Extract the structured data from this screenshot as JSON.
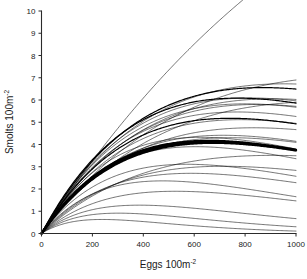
{
  "figure": {
    "background_color": "#ffffff",
    "line_color": "#000000",
    "axis_color": "#2b2b2b"
  },
  "axes": {
    "x_title_main": "Eggs 100m",
    "x_title_sup": "-2",
    "y_title_main": "Smolts 100m",
    "y_title_sup": "-2",
    "x_ticks": [
      "0",
      "200",
      "400",
      "600",
      "800",
      "1000"
    ],
    "y_ticks": [
      "0",
      "1",
      "2",
      "3",
      "4",
      "5",
      "6",
      "7",
      "8",
      "9",
      "10"
    ]
  },
  "chart_data": {
    "type": "line",
    "title": "",
    "xlabel": "Eggs 100m-2",
    "ylabel": "Smolts 100m-2",
    "xlim": [
      0,
      1000
    ],
    "ylim": [
      0,
      10
    ],
    "xticks": [
      0,
      200,
      400,
      600,
      800,
      1000
    ],
    "yticks": [
      0,
      1,
      2,
      3,
      4,
      5,
      6,
      7,
      8,
      9,
      10
    ],
    "grid": false,
    "legend": "none",
    "annotation": "Family of Ricker stock-recruitment curves, all passing through the origin. Each curve is R = a*S*exp(-b*S). Curves are overplotted, forming dense dark bands near y=3.2-3.8 and y=4.8-5.6.",
    "x": [
      0,
      25,
      50,
      75,
      100,
      125,
      150,
      175,
      200,
      250,
      300,
      350,
      400,
      450,
      500,
      550,
      600,
      650,
      700,
      750,
      800,
      850,
      900,
      950,
      1000
    ],
    "series": [
      {
        "name": "curve-01-highest",
        "emphasis": "normal",
        "a": 0.0152,
        "b": 0.00079,
        "values": [
          0,
          0.37,
          0.73,
          1.08,
          1.41,
          1.72,
          2.02,
          2.31,
          2.6,
          3.12,
          3.6,
          4.05,
          4.44,
          4.8,
          5.13,
          5.43,
          5.7,
          5.94,
          6.16,
          6.37,
          6.56,
          6.73,
          6.89,
          7.04,
          7.15
        ]
      },
      {
        "name": "curve-02-top",
        "emphasis": "normal",
        "a": 0.0175,
        "b": 0.00035,
        "values": [
          0,
          0.43,
          0.86,
          1.28,
          1.69,
          2.09,
          2.48,
          2.85,
          3.22,
          3.91,
          4.57,
          5.17,
          5.74,
          6.27,
          6.76,
          7.21,
          7.63,
          8.01,
          8.35,
          8.5,
          8.6,
          8.65,
          8.66,
          8.66,
          8.64
        ]
      },
      {
        "name": "curve-03",
        "emphasis": "normal",
        "a": 0.0168,
        "b": 0.0014,
        "values": [
          0,
          0.4,
          0.78,
          1.14,
          1.46,
          1.76,
          2.04,
          2.3,
          2.54,
          2.95,
          3.31,
          3.6,
          3.84,
          4.04,
          4.19,
          4.3,
          4.37,
          4.41,
          4.43,
          4.42,
          4.39,
          4.34,
          4.28,
          4.2,
          4.12
        ]
      },
      {
        "name": "curve-04-band-upper",
        "emphasis": "medium",
        "a": 0.0215,
        "b": 0.0013,
        "values": [
          0,
          0.52,
          1.0,
          1.46,
          1.89,
          2.28,
          2.65,
          3.0,
          3.32,
          3.88,
          4.36,
          4.77,
          5.11,
          5.39,
          5.6,
          5.75,
          5.86,
          5.92,
          5.94,
          5.94,
          5.9,
          5.85,
          5.77,
          5.68,
          5.58
        ]
      },
      {
        "name": "curve-05-band-upper",
        "emphasis": "medium",
        "a": 0.0205,
        "b": 0.00115,
        "values": [
          0,
          0.5,
          0.97,
          1.41,
          1.83,
          2.22,
          2.59,
          2.94,
          3.26,
          3.84,
          4.34,
          4.78,
          5.16,
          5.48,
          5.74,
          5.95,
          6.1,
          6.21,
          6.29,
          6.33,
          6.33,
          6.3,
          6.25,
          6.18,
          6.08
        ]
      },
      {
        "name": "curve-06",
        "emphasis": "normal",
        "a": 0.0192,
        "b": 0.00105,
        "values": [
          0,
          0.47,
          0.91,
          1.33,
          1.73,
          2.1,
          2.46,
          2.8,
          3.11,
          3.68,
          4.18,
          4.61,
          4.99,
          5.31,
          5.58,
          5.8,
          5.97,
          6.09,
          6.19,
          6.24,
          6.26,
          6.25,
          6.21,
          6.15,
          6.07
        ]
      },
      {
        "name": "curve-07",
        "emphasis": "normal",
        "a": 0.0188,
        "b": 0.0016,
        "values": [
          0,
          0.45,
          0.87,
          1.26,
          1.6,
          1.92,
          2.21,
          2.47,
          2.71,
          3.1,
          3.41,
          3.65,
          3.83,
          3.95,
          4.03,
          4.07,
          4.07,
          4.05,
          4.01,
          3.95,
          3.88,
          3.8,
          3.71,
          3.62,
          3.52
        ]
      },
      {
        "name": "curve-08-dense",
        "emphasis": "normal",
        "a": 0.0198,
        "b": 0.00125,
        "values": [
          0,
          0.48,
          0.93,
          1.35,
          1.75,
          2.12,
          2.46,
          2.78,
          3.08,
          3.6,
          4.05,
          4.42,
          4.73,
          4.98,
          5.17,
          5.31,
          5.41,
          5.46,
          5.48,
          5.47,
          5.44,
          5.38,
          5.31,
          5.22,
          5.12
        ]
      },
      {
        "name": "curve-09-dense",
        "emphasis": "normal",
        "a": 0.0202,
        "b": 0.00122,
        "values": [
          0,
          0.49,
          0.95,
          1.38,
          1.79,
          2.17,
          2.52,
          2.85,
          3.16,
          3.7,
          4.17,
          4.56,
          4.88,
          5.14,
          5.34,
          5.49,
          5.59,
          5.65,
          5.67,
          5.67,
          5.64,
          5.58,
          5.51,
          5.42,
          5.32
        ]
      },
      {
        "name": "curve-10-dense-dark",
        "emphasis": "medium",
        "a": 0.019,
        "b": 0.00135,
        "values": [
          0,
          0.46,
          0.89,
          1.29,
          1.66,
          2.0,
          2.33,
          2.62,
          2.9,
          3.37,
          3.77,
          4.09,
          4.35,
          4.55,
          4.7,
          4.8,
          4.86,
          4.89,
          4.89,
          4.86,
          4.81,
          4.74,
          4.66,
          4.57,
          4.47
        ]
      },
      {
        "name": "curve-11-dense",
        "emphasis": "normal",
        "a": 0.0186,
        "b": 0.00118,
        "values": [
          0,
          0.45,
          0.88,
          1.28,
          1.65,
          2.0,
          2.34,
          2.65,
          2.94,
          3.46,
          3.91,
          4.28,
          4.59,
          4.84,
          5.04,
          5.18,
          5.28,
          5.34,
          5.37,
          5.37,
          5.34,
          5.29,
          5.23,
          5.15,
          5.06
        ]
      },
      {
        "name": "curve-12-dense",
        "emphasis": "normal",
        "a": 0.0181,
        "b": 0.0011,
        "values": [
          0,
          0.44,
          0.86,
          1.25,
          1.62,
          1.97,
          2.3,
          2.61,
          2.9,
          3.43,
          3.89,
          4.28,
          4.61,
          4.88,
          5.09,
          5.26,
          5.38,
          5.46,
          5.5,
          5.52,
          5.5,
          5.47,
          5.41,
          5.34,
          5.26
        ]
      },
      {
        "name": "curve-13",
        "emphasis": "normal",
        "a": 0.0175,
        "b": 0.00165,
        "values": [
          0,
          0.42,
          0.81,
          1.16,
          1.48,
          1.77,
          2.03,
          2.26,
          2.47,
          2.81,
          3.07,
          3.26,
          3.39,
          3.47,
          3.52,
          3.53,
          3.51,
          3.47,
          3.42,
          3.35,
          3.27,
          3.19,
          3.11,
          3.02,
          2.93
        ]
      },
      {
        "name": "curve-14-thickband",
        "emphasis": "thick",
        "a": 0.0168,
        "b": 0.0015,
        "values": [
          0,
          0.4,
          0.78,
          1.13,
          1.45,
          1.74,
          2.01,
          2.25,
          2.47,
          2.84,
          3.13,
          3.35,
          3.51,
          3.61,
          3.68,
          3.71,
          3.71,
          3.69,
          3.65,
          3.59,
          3.53,
          3.45,
          3.37,
          3.29,
          3.2
        ]
      },
      {
        "name": "curve-15-thickband",
        "emphasis": "thick",
        "a": 0.0172,
        "b": 0.00152,
        "values": [
          0,
          0.41,
          0.8,
          1.16,
          1.48,
          1.78,
          2.05,
          2.3,
          2.52,
          2.9,
          3.2,
          3.42,
          3.58,
          3.69,
          3.75,
          3.78,
          3.78,
          3.76,
          3.72,
          3.66,
          3.59,
          3.51,
          3.43,
          3.35,
          3.26
        ]
      },
      {
        "name": "curve-16-thickband",
        "emphasis": "thick",
        "a": 0.0164,
        "b": 0.00148,
        "values": [
          0,
          0.39,
          0.76,
          1.1,
          1.41,
          1.7,
          1.96,
          2.2,
          2.41,
          2.78,
          3.06,
          3.28,
          3.44,
          3.54,
          3.6,
          3.63,
          3.63,
          3.61,
          3.58,
          3.52,
          3.46,
          3.39,
          3.31,
          3.23,
          3.14
        ]
      },
      {
        "name": "curve-17",
        "emphasis": "normal",
        "a": 0.0155,
        "b": 0.0012,
        "values": [
          0,
          0.38,
          0.73,
          1.06,
          1.37,
          1.66,
          1.94,
          2.19,
          2.44,
          2.87,
          3.24,
          3.55,
          3.81,
          4.02,
          4.18,
          4.3,
          4.38,
          4.43,
          4.45,
          4.45,
          4.43,
          4.39,
          4.33,
          4.27,
          4.19
        ]
      },
      {
        "name": "curve-18",
        "emphasis": "normal",
        "a": 0.0145,
        "b": 0.0009,
        "values": [
          0,
          0.35,
          0.69,
          1.02,
          1.33,
          1.62,
          1.9,
          2.17,
          2.42,
          2.89,
          3.32,
          3.69,
          4.02,
          4.3,
          4.54,
          4.73,
          4.89,
          5.01,
          5.1,
          5.16,
          5.2,
          5.21,
          5.2,
          5.17,
          5.13
        ]
      },
      {
        "name": "curve-19",
        "emphasis": "normal",
        "a": 0.0135,
        "b": 0.0021,
        "values": [
          0,
          0.32,
          0.61,
          0.86,
          1.09,
          1.29,
          1.46,
          1.61,
          1.73,
          1.93,
          2.06,
          2.13,
          2.16,
          2.16,
          2.14,
          2.1,
          2.05,
          1.99,
          1.93,
          1.86,
          1.79,
          1.72,
          1.65,
          1.58,
          1.51
        ]
      },
      {
        "name": "curve-20",
        "emphasis": "normal",
        "a": 0.0125,
        "b": 0.0017,
        "values": [
          0,
          0.3,
          0.57,
          0.82,
          1.05,
          1.26,
          1.45,
          1.62,
          1.77,
          2.03,
          2.23,
          2.38,
          2.48,
          2.54,
          2.57,
          2.58,
          2.56,
          2.53,
          2.49,
          2.44,
          2.38,
          2.32,
          2.26,
          2.19,
          2.12
        ]
      },
      {
        "name": "curve-21",
        "emphasis": "normal",
        "a": 0.0115,
        "b": 0.0014,
        "values": [
          0,
          0.28,
          0.53,
          0.78,
          1.0,
          1.21,
          1.4,
          1.58,
          1.74,
          2.02,
          2.26,
          2.45,
          2.6,
          2.71,
          2.78,
          2.83,
          2.85,
          2.85,
          2.84,
          2.81,
          2.77,
          2.72,
          2.67,
          2.61,
          2.55
        ]
      },
      {
        "name": "curve-22",
        "emphasis": "normal",
        "a": 0.0105,
        "b": 0.0011,
        "values": [
          0,
          0.26,
          0.5,
          0.73,
          0.95,
          1.16,
          1.35,
          1.53,
          1.71,
          2.02,
          2.29,
          2.52,
          2.71,
          2.87,
          3.0,
          3.09,
          3.16,
          3.2,
          3.23,
          3.24,
          3.23,
          3.21,
          3.18,
          3.15,
          3.1
        ]
      },
      {
        "name": "curve-23",
        "emphasis": "normal",
        "a": 0.0098,
        "b": 0.0019,
        "values": [
          0,
          0.23,
          0.45,
          0.64,
          0.82,
          0.98,
          1.12,
          1.24,
          1.35,
          1.52,
          1.65,
          1.73,
          1.78,
          1.8,
          1.8,
          1.78,
          1.76,
          1.72,
          1.68,
          1.63,
          1.58,
          1.53,
          1.48,
          1.43,
          1.38
        ]
      },
      {
        "name": "curve-24",
        "emphasis": "normal",
        "a": 0.009,
        "b": 0.0026,
        "values": [
          0,
          0.21,
          0.39,
          0.56,
          0.69,
          0.81,
          0.91,
          0.99,
          1.06,
          1.15,
          1.2,
          1.21,
          1.19,
          1.15,
          1.11,
          1.05,
          0.99,
          0.93,
          0.87,
          0.81,
          0.75,
          0.7,
          0.65,
          0.6,
          0.55
        ]
      },
      {
        "name": "curve-25",
        "emphasis": "normal",
        "a": 0.0082,
        "b": 0.0033,
        "values": [
          0,
          0.19,
          0.35,
          0.48,
          0.59,
          0.68,
          0.75,
          0.8,
          0.84,
          0.88,
          0.89,
          0.87,
          0.83,
          0.78,
          0.72,
          0.66,
          0.6,
          0.54,
          0.49,
          0.44,
          0.39,
          0.34,
          0.3,
          0.27,
          0.24
        ]
      },
      {
        "name": "curve-26-lowest",
        "emphasis": "normal",
        "a": 0.0072,
        "b": 0.0042,
        "values": [
          0,
          0.16,
          0.29,
          0.39,
          0.47,
          0.53,
          0.57,
          0.6,
          0.62,
          0.62,
          0.6,
          0.55,
          0.5,
          0.44,
          0.38,
          0.32,
          0.27,
          0.22,
          0.18,
          0.15,
          0.12,
          0.1,
          0.08,
          0.06,
          0.05
        ]
      },
      {
        "name": "curve-27-dense",
        "emphasis": "normal",
        "a": 0.0193,
        "b": 0.0013,
        "values": [
          0,
          0.47,
          0.9,
          1.31,
          1.69,
          2.05,
          2.38,
          2.69,
          2.98,
          3.48,
          3.9,
          4.25,
          4.53,
          4.75,
          4.92,
          5.04,
          5.12,
          5.16,
          5.17,
          5.15,
          5.11,
          5.05,
          4.97,
          4.89,
          4.79
        ]
      },
      {
        "name": "curve-28-dense",
        "emphasis": "normal",
        "a": 0.0178,
        "b": 0.00128,
        "values": [
          0,
          0.43,
          0.83,
          1.21,
          1.57,
          1.9,
          2.21,
          2.5,
          2.76,
          3.23,
          3.62,
          3.95,
          4.21,
          4.42,
          4.57,
          4.68,
          4.75,
          4.79,
          4.79,
          4.77,
          4.73,
          4.67,
          4.6,
          4.52,
          4.43
        ]
      },
      {
        "name": "curve-29-dense",
        "emphasis": "normal",
        "a": 0.0158,
        "b": 0.00135,
        "values": [
          0,
          0.38,
          0.74,
          1.07,
          1.38,
          1.67,
          1.94,
          2.18,
          2.41,
          2.8,
          3.13,
          3.4,
          3.61,
          3.78,
          3.9,
          3.98,
          4.03,
          4.05,
          4.05,
          4.04,
          4.0,
          3.95,
          3.89,
          3.82,
          3.74
        ]
      },
      {
        "name": "curve-30",
        "emphasis": "normal",
        "a": 0.0148,
        "b": 0.00175,
        "values": [
          0,
          0.35,
          0.68,
          0.98,
          1.24,
          1.48,
          1.69,
          1.87,
          2.03,
          2.28,
          2.45,
          2.55,
          2.6,
          2.61,
          2.59,
          2.55,
          2.49,
          2.42,
          2.35,
          2.27,
          2.19,
          2.1,
          2.02,
          1.94,
          1.86
        ]
      }
    ]
  }
}
